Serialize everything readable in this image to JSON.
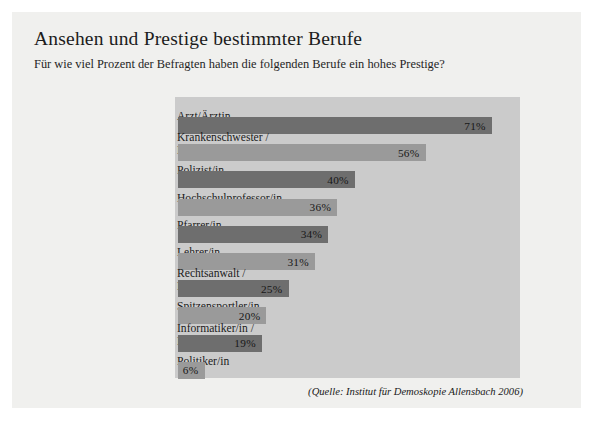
{
  "card": {
    "title": "Ansehen und Prestige bestimmter Berufe",
    "subtitle": "Für wie viel Prozent der Befragten haben die folgenden Berufe ein hohes Prestige?",
    "source": "(Quelle: Institut für Demoskopie Allensbach 2006)"
  },
  "colors": {
    "page_background": "#ffffff",
    "card_background": "#f0f0ee",
    "panel_background": "#cbcbcb",
    "bar_dark": "#6e6e6e",
    "bar_light": "#9a9a9a",
    "text": "#1b1b1b"
  },
  "chart_data": {
    "type": "bar",
    "orientation": "horizontal",
    "title": "Ansehen und Prestige bestimmter Berufe",
    "subtitle": "Für wie viel Prozent der Befragten haben die folgenden Berufe ein hohes Prestige?",
    "xlabel": "",
    "ylabel": "",
    "xlim": [
      0,
      78
    ],
    "grid": false,
    "legend": false,
    "unit": "%",
    "categories": [
      "Arzt/Ärztin",
      "Krankenschwester /\nKrankenpfleger",
      "Polizist/in",
      "Hochschulprofessor/in",
      "Pfarrer/in",
      "Lehrer/in",
      "Rechtsanwalt /\nRechtsanwältin",
      "Spitzensportler/in",
      "Informatiker/in /\nProgrammierer/in",
      "Politiker/in"
    ],
    "values": [
      71,
      56,
      40,
      36,
      34,
      31,
      25,
      20,
      19,
      6
    ],
    "value_labels": [
      "71%",
      "56%",
      "40%",
      "36%",
      "34%",
      "31%",
      "25%",
      "20%",
      "19%",
      "6%"
    ],
    "bar_colors": [
      "dark",
      "light",
      "dark",
      "light",
      "dark",
      "light",
      "dark",
      "light",
      "dark",
      "light"
    ],
    "source": "(Quelle: Institut für Demoskopie Allensbach 2006)"
  }
}
